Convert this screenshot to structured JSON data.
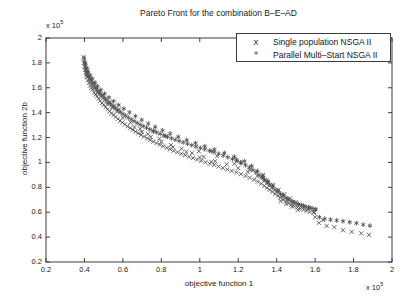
{
  "chart_data": {
    "type": "scatter",
    "title": "Pareto Front for the combination B–E–AD",
    "xlabel": "objective function 1",
    "ylabel": "objective function 2b",
    "x_exponent_label": "x 10",
    "x_exponent_power": "5",
    "y_exponent_label": "x 10",
    "y_exponent_power": "5",
    "xlim": [
      0.2,
      2.0
    ],
    "ylim": [
      0.2,
      2.0
    ],
    "xticks": [
      "0.2",
      "0.4",
      "0.6",
      "0.8",
      "1",
      "1.2",
      "1.4",
      "1.6",
      "1.8",
      "2"
    ],
    "yticks": [
      "0.2",
      "0.4",
      "0.6",
      "0.8",
      "1",
      "1.2",
      "1.4",
      "1.6",
      "1.8",
      "2"
    ],
    "xtick_values": [
      0.2,
      0.4,
      0.6,
      0.8,
      1.0,
      1.2,
      1.4,
      1.6,
      1.8,
      2.0
    ],
    "ytick_values": [
      0.2,
      0.4,
      0.6,
      0.8,
      1.0,
      1.2,
      1.4,
      1.6,
      1.8,
      2.0
    ],
    "grid": false,
    "legend_position": "top-right",
    "series": [
      {
        "name": "Single population NSGA II",
        "marker": "x",
        "color": "#4a4a4a",
        "points": [
          [
            0.395,
            1.845
          ],
          [
            0.398,
            1.8
          ],
          [
            0.402,
            1.77
          ],
          [
            0.404,
            1.745
          ],
          [
            0.408,
            1.72
          ],
          [
            0.41,
            1.7
          ],
          [
            0.413,
            1.686
          ],
          [
            0.418,
            1.66
          ],
          [
            0.424,
            1.64
          ],
          [
            0.43,
            1.618
          ],
          [
            0.436,
            1.6
          ],
          [
            0.442,
            1.585
          ],
          [
            0.45,
            1.562
          ],
          [
            0.458,
            1.545
          ],
          [
            0.466,
            1.53
          ],
          [
            0.474,
            1.512
          ],
          [
            0.482,
            1.495
          ],
          [
            0.492,
            1.478
          ],
          [
            0.5,
            1.462
          ],
          [
            0.51,
            1.444
          ],
          [
            0.52,
            1.428
          ],
          [
            0.53,
            1.41
          ],
          [
            0.541,
            1.396
          ],
          [
            0.552,
            1.382
          ],
          [
            0.562,
            1.366
          ],
          [
            0.574,
            1.35
          ],
          [
            0.586,
            1.334
          ],
          [
            0.598,
            1.32
          ],
          [
            0.61,
            1.305
          ],
          [
            0.624,
            1.29
          ],
          [
            0.638,
            1.276
          ],
          [
            0.652,
            1.262
          ],
          [
            0.666,
            1.248
          ],
          [
            0.68,
            1.234
          ],
          [
            0.694,
            1.22
          ],
          [
            0.71,
            1.208
          ],
          [
            0.726,
            1.194
          ],
          [
            0.742,
            1.18
          ],
          [
            0.758,
            1.168
          ],
          [
            0.775,
            1.155
          ],
          [
            0.792,
            1.143
          ],
          [
            0.81,
            1.13
          ],
          [
            0.828,
            1.118
          ],
          [
            0.846,
            1.106
          ],
          [
            0.864,
            1.094
          ],
          [
            0.884,
            1.082
          ],
          [
            0.904,
            1.07
          ],
          [
            0.924,
            1.058
          ],
          [
            0.944,
            1.046
          ],
          [
            0.965,
            1.035
          ],
          [
            0.986,
            1.024
          ],
          [
            1.008,
            1.013
          ],
          [
            1.03,
            1.002
          ],
          [
            1.052,
            0.991
          ],
          [
            1.075,
            0.98
          ],
          [
            1.098,
            0.968
          ],
          [
            1.12,
            0.956
          ],
          [
            1.143,
            0.944
          ],
          [
            1.166,
            0.932
          ],
          [
            1.19,
            0.92
          ],
          [
            1.214,
            0.906
          ],
          [
            1.238,
            0.892
          ],
          [
            1.26,
            0.878
          ],
          [
            1.282,
            0.862
          ],
          [
            1.302,
            0.846
          ],
          [
            1.32,
            0.83
          ],
          [
            1.336,
            0.812
          ],
          [
            1.35,
            0.796
          ],
          [
            1.364,
            0.78
          ],
          [
            1.378,
            0.764
          ],
          [
            1.392,
            0.748
          ],
          [
            1.406,
            0.732
          ],
          [
            1.42,
            0.716
          ],
          [
            1.434,
            0.7
          ],
          [
            1.448,
            0.686
          ],
          [
            1.462,
            0.672
          ],
          [
            1.476,
            0.66
          ],
          [
            1.492,
            0.648
          ],
          [
            1.508,
            0.638
          ],
          [
            1.524,
            0.628
          ],
          [
            1.54,
            0.62
          ],
          [
            1.556,
            0.612
          ],
          [
            1.574,
            0.604
          ],
          [
            1.592,
            0.596
          ],
          [
            0.47,
            1.56
          ],
          [
            0.52,
            1.47
          ],
          [
            0.545,
            1.44
          ],
          [
            0.57,
            1.41
          ],
          [
            0.6,
            1.36
          ],
          [
            0.64,
            1.32
          ],
          [
            0.69,
            1.27
          ],
          [
            0.73,
            1.23
          ],
          [
            0.79,
            1.19
          ],
          [
            0.85,
            1.14
          ],
          [
            0.905,
            1.11
          ],
          [
            0.96,
            1.075
          ],
          [
            1.02,
            1.045
          ],
          [
            1.08,
            1.01
          ],
          [
            1.14,
            0.985
          ],
          [
            1.2,
            0.955
          ],
          [
            1.25,
            0.925
          ],
          [
            1.3,
            0.89
          ],
          [
            1.34,
            0.86
          ],
          [
            1.38,
            0.82
          ],
          [
            1.41,
            0.78
          ],
          [
            1.44,
            0.745
          ],
          [
            1.47,
            0.71
          ],
          [
            1.5,
            0.68
          ],
          [
            1.53,
            0.655
          ],
          [
            1.56,
            0.63
          ],
          [
            1.595,
            0.6
          ],
          [
            1.33,
            0.9
          ],
          [
            1.18,
            0.99
          ],
          [
            1.26,
            0.94
          ],
          [
            1.09,
            1.05
          ],
          [
            0.995,
            1.09
          ],
          [
            1.42,
            0.69
          ],
          [
            1.45,
            0.668
          ],
          [
            1.48,
            0.645
          ],
          [
            1.51,
            0.618
          ],
          [
            1.62,
            0.515
          ],
          [
            1.66,
            0.49
          ],
          [
            1.7,
            0.48
          ],
          [
            1.745,
            0.455
          ],
          [
            1.79,
            0.442
          ],
          [
            1.84,
            0.43
          ],
          [
            1.88,
            0.418
          ],
          [
            1.6,
            0.56
          ],
          [
            1.64,
            0.538
          ],
          [
            0.415,
            1.74
          ],
          [
            0.425,
            1.7
          ],
          [
            0.435,
            1.67
          ],
          [
            0.448,
            1.64
          ],
          [
            0.462,
            1.605
          ],
          [
            0.478,
            1.575
          ],
          [
            0.495,
            1.545
          ],
          [
            0.512,
            1.515
          ],
          [
            0.533,
            1.485
          ],
          [
            0.556,
            1.455
          ],
          [
            0.58,
            1.425
          ],
          [
            0.66,
            1.285
          ],
          [
            0.7,
            1.245
          ],
          [
            0.745,
            1.205
          ],
          [
            0.8,
            1.165
          ],
          [
            0.86,
            1.125
          ],
          [
            0.93,
            1.085
          ],
          [
            1.0,
            1.04
          ],
          [
            1.06,
            1.005
          ]
        ]
      },
      {
        "name": "Parallel Multi–Start NSGA II",
        "marker": "*",
        "color": "#525252",
        "points": [
          [
            0.398,
            1.84
          ],
          [
            0.4,
            1.812
          ],
          [
            0.403,
            1.786
          ],
          [
            0.406,
            1.76
          ],
          [
            0.411,
            1.735
          ],
          [
            0.416,
            1.712
          ],
          [
            0.421,
            1.69
          ],
          [
            0.428,
            1.668
          ],
          [
            0.435,
            1.648
          ],
          [
            0.443,
            1.628
          ],
          [
            0.452,
            1.608
          ],
          [
            0.461,
            1.59
          ],
          [
            0.47,
            1.572
          ],
          [
            0.48,
            1.552
          ],
          [
            0.49,
            1.535
          ],
          [
            0.501,
            1.518
          ],
          [
            0.512,
            1.5
          ],
          [
            0.524,
            1.484
          ],
          [
            0.536,
            1.468
          ],
          [
            0.548,
            1.452
          ],
          [
            0.56,
            1.436
          ],
          [
            0.573,
            1.42
          ],
          [
            0.586,
            1.405
          ],
          [
            0.6,
            1.39
          ],
          [
            0.614,
            1.375
          ],
          [
            0.628,
            1.36
          ],
          [
            0.643,
            1.346
          ],
          [
            0.658,
            1.332
          ],
          [
            0.674,
            1.318
          ],
          [
            0.69,
            1.304
          ],
          [
            0.706,
            1.292
          ],
          [
            0.723,
            1.279
          ],
          [
            0.74,
            1.266
          ],
          [
            0.758,
            1.254
          ],
          [
            0.776,
            1.242
          ],
          [
            0.794,
            1.23
          ],
          [
            0.813,
            1.218
          ],
          [
            0.832,
            1.206
          ],
          [
            0.852,
            1.194
          ],
          [
            0.872,
            1.183
          ],
          [
            0.893,
            1.172
          ],
          [
            0.914,
            1.161
          ],
          [
            0.936,
            1.15
          ],
          [
            0.958,
            1.139
          ],
          [
            0.98,
            1.128
          ],
          [
            1.003,
            1.117
          ],
          [
            1.026,
            1.106
          ],
          [
            1.05,
            1.095
          ],
          [
            1.074,
            1.083
          ],
          [
            1.098,
            1.07
          ],
          [
            1.122,
            1.056
          ],
          [
            1.146,
            1.042
          ],
          [
            1.17,
            1.028
          ],
          [
            1.194,
            1.012
          ],
          [
            1.216,
            0.996
          ],
          [
            1.238,
            0.978
          ],
          [
            1.258,
            0.96
          ],
          [
            1.276,
            0.94
          ],
          [
            1.292,
            0.92
          ],
          [
            1.308,
            0.9
          ],
          [
            1.322,
            0.88
          ],
          [
            1.336,
            0.86
          ],
          [
            1.35,
            0.84
          ],
          [
            1.364,
            0.82
          ],
          [
            1.378,
            0.8
          ],
          [
            1.392,
            0.782
          ],
          [
            1.406,
            0.764
          ],
          [
            1.42,
            0.746
          ],
          [
            1.434,
            0.73
          ],
          [
            1.449,
            0.714
          ],
          [
            1.464,
            0.7
          ],
          [
            1.48,
            0.688
          ],
          [
            1.496,
            0.676
          ],
          [
            1.513,
            0.666
          ],
          [
            1.53,
            0.656
          ],
          [
            1.548,
            0.648
          ],
          [
            1.566,
            0.64
          ],
          [
            1.584,
            0.632
          ],
          [
            1.603,
            0.624
          ],
          [
            1.622,
            0.56
          ],
          [
            1.65,
            0.548
          ],
          [
            1.68,
            0.54
          ],
          [
            1.712,
            0.534
          ],
          [
            1.745,
            0.528
          ],
          [
            1.78,
            0.52
          ],
          [
            1.815,
            0.512
          ],
          [
            1.85,
            0.5
          ],
          [
            1.885,
            0.492
          ],
          [
            0.405,
            1.796
          ],
          [
            0.412,
            1.758
          ],
          [
            0.42,
            1.726
          ],
          [
            0.43,
            1.698
          ],
          [
            0.44,
            1.672
          ],
          [
            0.455,
            1.64
          ],
          [
            0.468,
            1.612
          ],
          [
            0.485,
            1.582
          ],
          [
            0.505,
            1.552
          ],
          [
            0.528,
            1.522
          ],
          [
            0.552,
            1.492
          ],
          [
            0.578,
            1.462
          ],
          [
            0.605,
            1.432
          ],
          [
            0.634,
            1.402
          ],
          [
            0.665,
            1.372
          ],
          [
            0.698,
            1.342
          ],
          [
            0.732,
            1.312
          ],
          [
            0.768,
            1.285
          ],
          [
            0.806,
            1.258
          ],
          [
            0.846,
            1.232
          ],
          [
            0.888,
            1.206
          ],
          [
            0.932,
            1.18
          ],
          [
            0.978,
            1.155
          ],
          [
            1.026,
            1.13
          ],
          [
            1.076,
            1.104
          ],
          [
            1.128,
            1.076
          ],
          [
            1.18,
            1.046
          ],
          [
            1.232,
            1.01
          ],
          [
            1.27,
            0.972
          ],
          [
            1.3,
            0.932
          ],
          [
            1.328,
            0.892
          ],
          [
            1.354,
            0.852
          ],
          [
            1.38,
            0.812
          ],
          [
            1.406,
            0.772
          ],
          [
            1.432,
            0.736
          ],
          [
            1.458,
            0.706
          ],
          [
            1.484,
            0.682
          ],
          [
            1.512,
            0.662
          ],
          [
            1.54,
            0.646
          ],
          [
            1.57,
            0.634
          ],
          [
            1.6,
            0.62
          ],
          [
            1.33,
            0.876
          ],
          [
            1.356,
            0.836
          ],
          [
            1.19,
            1.022
          ],
          [
            1.212,
            1.0
          ],
          [
            1.06,
            1.09
          ],
          [
            0.82,
            1.212
          ],
          [
            0.76,
            1.25
          ]
        ]
      }
    ]
  },
  "figure": {
    "background_color": "#ffffff",
    "axis_color": "#3c3c3c",
    "text_color": "#1a1a1a"
  }
}
